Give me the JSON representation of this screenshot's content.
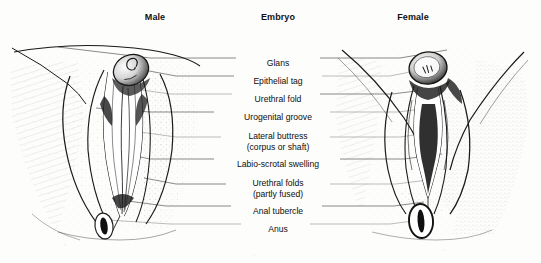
{
  "figure": {
    "type": "anatomical-illustration",
    "style": "stippled pen-and-ink line drawing, black on white, scanned",
    "background_color": "#fdfdfc",
    "ink_color": "#141414"
  },
  "headings": {
    "male": "Male",
    "embryo": "Embryo",
    "female": "Female"
  },
  "labels": [
    {
      "id": "glans",
      "line1": "Glans",
      "line2": "",
      "y": 12
    },
    {
      "id": "epithelial-tag",
      "line1": "Epithelial tag",
      "line2": "",
      "y": 30
    },
    {
      "id": "urethral-fold",
      "line1": "Urethral fold",
      "line2": "",
      "y": 48
    },
    {
      "id": "urogenital-groove",
      "line1": "Urogenital groove",
      "line2": "",
      "y": 66
    },
    {
      "id": "lateral-buttress",
      "line1": "Lateral buttress",
      "line2": "(corpus or shaft)",
      "y": 85
    },
    {
      "id": "labio-scrotal-swelling",
      "line1": "Labio-scrotal swelling",
      "line2": "",
      "y": 113
    },
    {
      "id": "urethral-folds",
      "line1": "Urethral folds",
      "line2": "(partly fused)",
      "y": 132
    },
    {
      "id": "anal-tubercle",
      "line1": "Anal tubercle",
      "line2": "",
      "y": 160
    },
    {
      "id": "anus",
      "line1": "Anus",
      "line2": "",
      "y": 178
    }
  ],
  "figures": {
    "male": {
      "name": "Male external genitalia",
      "side": "left",
      "parts": [
        "glans",
        "epithelial tag",
        "urethral fold",
        "urogenital groove",
        "lateral buttress",
        "labio-scrotal swelling",
        "urethral folds (partly fused)",
        "anal tubercle",
        "anus"
      ]
    },
    "female": {
      "name": "Female external genitalia",
      "side": "right",
      "parts": [
        "glans",
        "epithelial tag",
        "urethral fold",
        "urogenital groove",
        "lateral buttress",
        "labio-scrotal swelling",
        "urethral folds",
        "anal tubercle",
        "anus"
      ]
    }
  }
}
